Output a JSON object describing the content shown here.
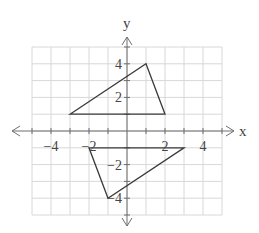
{
  "chart_data": {
    "type": "line",
    "title": "",
    "xlabel": "x",
    "ylabel": "y",
    "xlim": [
      -5,
      5
    ],
    "ylim": [
      -5,
      5
    ],
    "grid": true,
    "x_tick_labels": [
      {
        "value": -4,
        "label": "−4"
      },
      {
        "value": -2,
        "label": "−2"
      },
      {
        "value": 2,
        "label": "2"
      },
      {
        "value": 4,
        "label": "4"
      }
    ],
    "y_tick_labels": [
      {
        "value": 4,
        "label": "4"
      },
      {
        "value": 2,
        "label": "2"
      },
      {
        "value": -2,
        "label": "−2"
      },
      {
        "value": -4,
        "label": "−4"
      }
    ],
    "series": [
      {
        "name": "triangle-upper",
        "closed": true,
        "points": [
          [
            -3,
            1
          ],
          [
            1,
            4
          ],
          [
            2,
            1
          ]
        ]
      },
      {
        "name": "triangle-lower",
        "closed": true,
        "points": [
          [
            -2,
            -1
          ],
          [
            3,
            -1
          ],
          [
            -1,
            -4
          ]
        ]
      }
    ]
  }
}
